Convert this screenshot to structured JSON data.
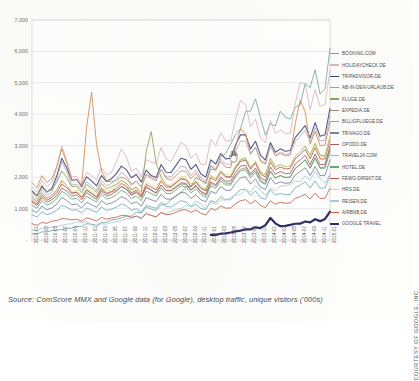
{
  "figure": {
    "source_note": "Source: ComScore MMX and Google data (for Google), desktop traffic, unique visitors ('000s)",
    "courtesy": "COURTESY OF GOOGLE, INC.",
    "cursor": "hand-pointer-cursor"
  },
  "chart_data": {
    "type": "line",
    "title": "",
    "xlabel": "",
    "ylabel": "",
    "ylim": [
      0,
      7000
    ],
    "yticks": [
      0,
      1000,
      2000,
      3000,
      4000,
      5000,
      6000,
      7000
    ],
    "ytick_labels": [
      "-",
      "1,000",
      "2,000",
      "3,000",
      "4,000",
      "5,000",
      "6,000",
      "7,000"
    ],
    "grid": true,
    "legend_position": "right",
    "units": "unique visitors ('000s)",
    "categories": [
      "2010-01",
      "2010-03",
      "2010-05",
      "2010-07",
      "2010-09",
      "2010-11",
      "2011-01",
      "2011-03",
      "2011-05",
      "2011-07",
      "2011-09",
      "2011-11",
      "2012-01",
      "2012-03",
      "2012-05",
      "2012-07",
      "2012-09",
      "2012-11",
      "2013-01",
      "2013-03",
      "2013-05",
      "2013-07",
      "2013-09",
      "2013-11",
      "2014-01",
      "2014-03",
      "2014-05",
      "2014-07",
      "2014-09",
      "2014-11",
      "2015-01"
    ],
    "series": [
      {
        "name": "BOOKING.COM",
        "color": "#74a8a4",
        "width": 1.0,
        "values": [
          200,
          260,
          300,
          340,
          380,
          430,
          500,
          560,
          640,
          700,
          760,
          860,
          980,
          1120,
          1280,
          1500,
          1700,
          1900,
          2250,
          2650,
          3050,
          3550,
          4100,
          3900,
          3700,
          4100,
          3850,
          4300,
          4850,
          4650,
          6100
        ]
      },
      {
        "name": "HOLIDAYCHECK.DE",
        "color": "#d9b4bd",
        "width": 1.0,
        "values": [
          1680,
          1900,
          1820,
          3000,
          2000,
          1780,
          2050,
          2300,
          2150,
          2900,
          2200,
          2000,
          2480,
          2950,
          2500,
          3100,
          2600,
          2400,
          3200,
          3400,
          3150,
          4450,
          3600,
          3250,
          3800,
          3500,
          3400,
          5000,
          4150,
          4250,
          5400
        ]
      },
      {
        "name": "TRIPADVISOR.DE",
        "color": "#3b3f6e",
        "width": 1.1,
        "values": [
          1560,
          1700,
          1640,
          2600,
          1900,
          1700,
          1880,
          2050,
          1950,
          2350,
          1980,
          1850,
          2050,
          2400,
          2150,
          2600,
          2250,
          2100,
          2550,
          2750,
          2600,
          3350,
          2900,
          2700,
          3100,
          2900,
          2850,
          3450,
          3250,
          3300,
          4180
        ]
      },
      {
        "name": "AB-IN-DEN-URLAUB.DE",
        "color": "#d08a52",
        "width": 1.0,
        "values": [
          1820,
          2050,
          1950,
          2900,
          1900,
          1720,
          4700,
          2200,
          1850,
          2000,
          1750,
          1680,
          2000,
          2250,
          1900,
          2200,
          1950,
          1900,
          2350,
          2500,
          2300,
          3550,
          2750,
          2500,
          3000,
          2750,
          2700,
          4450,
          3050,
          3000,
          3750
        ]
      },
      {
        "name": "FLUGE.DE",
        "color": "#92a05a",
        "width": 1.0,
        "values": [
          1500,
          1750,
          1600,
          2200,
          1700,
          1500,
          1650,
          1800,
          1700,
          1900,
          1600,
          1500,
          3450,
          2000,
          1700,
          1950,
          1700,
          1650,
          2050,
          2200,
          2000,
          2550,
          2300,
          2150,
          2600,
          2400,
          2350,
          2800,
          2700,
          2700,
          3300
        ]
      },
      {
        "name": "EXPEDIA.DE",
        "color": "#9b8a7a",
        "width": 1.0,
        "values": [
          1350,
          1500,
          1420,
          1900,
          1500,
          1350,
          1480,
          1600,
          1520,
          1700,
          1450,
          1380,
          1600,
          1750,
          1560,
          1780,
          1580,
          1520,
          1800,
          1950,
          1800,
          2250,
          2050,
          1900,
          2200,
          2050,
          2000,
          2400,
          2300,
          2300,
          2900
        ]
      },
      {
        "name": "BILLIGFLUEGE.DE",
        "color": "#6fb0bd",
        "width": 1.0,
        "values": [
          800,
          900,
          860,
          1100,
          950,
          860,
          950,
          1050,
          980,
          1150,
          950,
          880,
          1050,
          1200,
          1050,
          1250,
          1050,
          1000,
          1250,
          1380,
          1280,
          1600,
          1420,
          1350,
          1600,
          1480,
          1450,
          1750,
          1650,
          1650,
          2050
        ]
      },
      {
        "name": "TRIVAGO.DE",
        "color": "#7d7f9c",
        "width": 1.0,
        "values": [
          950,
          1080,
          1020,
          1350,
          1120,
          1020,
          1120,
          1250,
          1180,
          1380,
          1150,
          1080,
          1280,
          1450,
          1300,
          1520,
          1320,
          1280,
          1550,
          1700,
          1580,
          1980,
          1780,
          1680,
          1980,
          1850,
          1820,
          2180,
          2050,
          2050,
          2550
        ]
      },
      {
        "name": "OPODO.DE",
        "color": "#9e5f63",
        "width": 1.0,
        "values": [
          1200,
          1350,
          1280,
          1650,
          1400,
          1280,
          1400,
          1550,
          1450,
          1700,
          1420,
          1350,
          1580,
          1750,
          1580,
          1820,
          1600,
          1550,
          1850,
          2000,
          1880,
          2350,
          2100,
          1980,
          2320,
          2180,
          2120,
          2550,
          2400,
          2400,
          2980
        ]
      },
      {
        "name": "TRAVEL24.COM",
        "color": "#b3aac6",
        "width": 1.0,
        "values": [
          1420,
          1600,
          1520,
          2500,
          1750,
          1580,
          1720,
          1900,
          1800,
          2150,
          1780,
          1680,
          1950,
          2250,
          2000,
          2350,
          2050,
          1980,
          2380,
          2580,
          2420,
          3150,
          2720,
          2550,
          3000,
          2800,
          2750,
          3300,
          3120,
          3150,
          3950
        ]
      },
      {
        "name": "HOTEL.DE",
        "color": "#62a96e",
        "width": 1.0,
        "values": [
          1100,
          1250,
          1180,
          1550,
          1300,
          1180,
          1300,
          1450,
          1350,
          1580,
          1320,
          1250,
          1480,
          1650,
          1480,
          1720,
          1500,
          1450,
          1720,
          1880,
          1750,
          2200,
          1980,
          1850,
          2180,
          2050,
          2000,
          2400,
          2280,
          2280,
          2820
        ]
      },
      {
        "name": "FEWO-DIREKT.DE",
        "color": "#b35b52",
        "width": 1.0,
        "values": [
          1250,
          1420,
          1350,
          1780,
          1480,
          1350,
          1480,
          1650,
          1550,
          1800,
          1500,
          1420,
          1680,
          1880,
          1680,
          1950,
          1700,
          1650,
          1980,
          2150,
          2000,
          2500,
          2250,
          2100,
          2480,
          2320,
          2280,
          2720,
          2580,
          2580,
          3180
        ]
      },
      {
        "name": "HRS.DE",
        "color": "#e0dc82",
        "width": 1.0,
        "values": [
          1300,
          1480,
          1400,
          1850,
          1550,
          1400,
          1550,
          1720,
          1620,
          1880,
          1560,
          1480,
          1750,
          1950,
          1750,
          2020,
          1780,
          1720,
          2050,
          2220,
          2080,
          2600,
          2320,
          2180,
          2550,
          2400,
          2350,
          2800,
          2650,
          2650,
          3280
        ]
      },
      {
        "name": "REISEN.DE",
        "color": "#a9c9d6",
        "width": 1.0,
        "values": [
          320,
          380,
          420,
          470,
          520,
          560,
          480,
          520,
          560,
          620,
          680,
          720,
          780,
          850,
          920,
          1000,
          1080,
          1150,
          1200,
          1280,
          1350,
          1450,
          1520,
          1580,
          1650,
          1720,
          1780,
          1850,
          1900,
          1950,
          2100
        ]
      },
      {
        "name": "AIRBNB.DE",
        "color": "#c2634c",
        "width": 1.0,
        "values": [
          520,
          560,
          600,
          680,
          640,
          600,
          660,
          720,
          700,
          780,
          720,
          680,
          780,
          880,
          820,
          950,
          880,
          850,
          1000,
          1080,
          1020,
          1250,
          1150,
          1100,
          1250,
          1200,
          1180,
          1380,
          1300,
          1320,
          1650
        ]
      },
      {
        "name": "GOOGLE TRAVEL",
        "color": "#2e2f63",
        "width": 2.2,
        "start_index": 18,
        "values": [
          null,
          null,
          null,
          null,
          null,
          null,
          null,
          null,
          null,
          null,
          null,
          null,
          null,
          null,
          null,
          null,
          null,
          null,
          160,
          200,
          240,
          300,
          340,
          380,
          700,
          440,
          480,
          520,
          560,
          600,
          900
        ]
      }
    ]
  }
}
